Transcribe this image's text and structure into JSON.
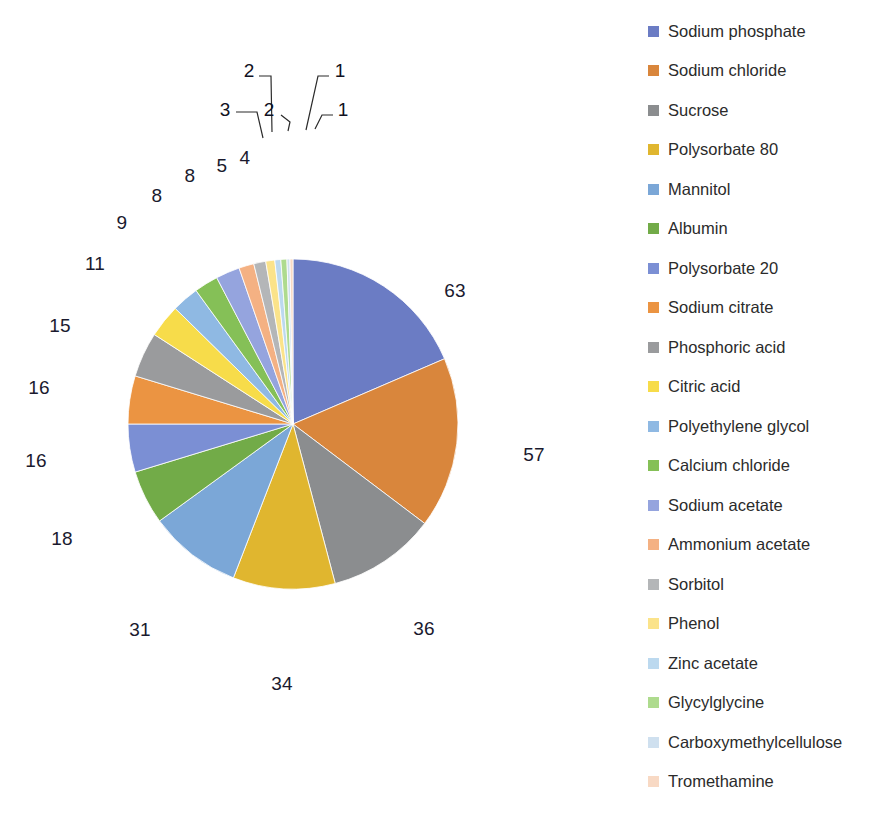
{
  "chart_data": {
    "type": "pie",
    "title": "",
    "subtitle": "",
    "xlabel": "",
    "ylabel": "",
    "grid": false,
    "legend_position": "right",
    "start_angle_deg": 0,
    "direction": "clockwise",
    "total": 336,
    "categories": [
      "Sodium phosphate",
      "Sodium chloride",
      "Sucrose",
      "Polysorbate 80",
      "Mannitol",
      "Albumin",
      "Polysorbate 20",
      "Sodium citrate",
      "Phosphoric acid",
      "Citric acid",
      "Polyethylene glycol",
      "Calcium chloride",
      "Sodium acetate",
      "Ammonium acetate",
      "Sorbitol",
      "Phenol",
      "Zinc acetate",
      "Glycylglycine",
      "Carboxymethylcellulose",
      "Tromethamine"
    ],
    "values": [
      63,
      57,
      36,
      34,
      31,
      18,
      16,
      16,
      15,
      11,
      9,
      8,
      8,
      5,
      4,
      3,
      2,
      2,
      1,
      1
    ],
    "colors": [
      "#6b7cc4",
      "#d9863c",
      "#8b8d8f",
      "#e0b62f",
      "#7ba7d7",
      "#72ab48",
      "#7b8fd4",
      "#eb9442",
      "#9a9b9d",
      "#f7dc4a",
      "#8fb9e3",
      "#85c057",
      "#95a4de",
      "#f4b183",
      "#b4b6b8",
      "#fbe38a",
      "#bcd9ef",
      "#aedb8e",
      "#cfe0ef",
      "#f8d9c4"
    ],
    "data_labels": [
      {
        "value": "63",
        "category": "Sodium phosphate",
        "type": "inside"
      },
      {
        "value": "57",
        "category": "Sodium chloride",
        "type": "inside"
      },
      {
        "value": "36",
        "category": "Sucrose",
        "type": "inside"
      },
      {
        "value": "34",
        "category": "Polysorbate 80",
        "type": "inside"
      },
      {
        "value": "31",
        "category": "Mannitol",
        "type": "inside"
      },
      {
        "value": "18",
        "category": "Albumin",
        "type": "inside"
      },
      {
        "value": "16",
        "category": "Polysorbate 20",
        "type": "inside"
      },
      {
        "value": "16",
        "category": "Sodium citrate",
        "type": "inside"
      },
      {
        "value": "15",
        "category": "Phosphoric acid",
        "type": "inside"
      },
      {
        "value": "11",
        "category": "Citric acid",
        "type": "inside"
      },
      {
        "value": "9",
        "category": "Polyethylene glycol",
        "type": "inside"
      },
      {
        "value": "8",
        "category": "Calcium chloride",
        "type": "inside"
      },
      {
        "value": "8",
        "category": "Sodium acetate",
        "type": "inside"
      },
      {
        "value": "5",
        "category": "Ammonium acetate",
        "type": "inside"
      },
      {
        "value": "4",
        "category": "Sorbitol",
        "type": "inside"
      },
      {
        "value": "3",
        "category": "Phenol",
        "type": "callout"
      },
      {
        "value": "2",
        "category": "Zinc acetate",
        "type": "callout"
      },
      {
        "value": "2",
        "category": "Glycylglycine",
        "type": "callout"
      },
      {
        "value": "1",
        "category": "Carboxymethylcellulose",
        "type": "callout"
      },
      {
        "value": "1",
        "category": "Tromethamine",
        "type": "callout"
      }
    ]
  },
  "pie": {
    "center_x": 293,
    "center_y": 424,
    "radius": 165,
    "inside_labels": [
      {
        "text": "63",
        "x": 455,
        "y": 291
      },
      {
        "text": "57",
        "x": 534,
        "y": 455
      },
      {
        "text": "36",
        "x": 424,
        "y": 629
      },
      {
        "text": "34",
        "x": 282,
        "y": 684
      },
      {
        "text": "31",
        "x": 140,
        "y": 630
      },
      {
        "text": "18",
        "x": 62,
        "y": 539
      },
      {
        "text": "16",
        "x": 36,
        "y": 461
      },
      {
        "text": "16",
        "x": 39,
        "y": 388
      },
      {
        "text": "15",
        "x": 60,
        "y": 326
      },
      {
        "text": "11",
        "x": 95,
        "y": 264
      },
      {
        "text": "9",
        "x": 122,
        "y": 223
      },
      {
        "text": "8",
        "x": 157,
        "y": 196
      },
      {
        "text": "8",
        "x": 190,
        "y": 176
      },
      {
        "text": "5",
        "x": 222,
        "y": 166
      },
      {
        "text": "4",
        "x": 245,
        "y": 158
      }
    ],
    "callout_labels": [
      {
        "text": "3",
        "x": 225,
        "y": 110
      },
      {
        "text": "2",
        "x": 249,
        "y": 71
      },
      {
        "text": "2",
        "x": 269,
        "y": 110
      },
      {
        "text": "1",
        "x": 340,
        "y": 71
      },
      {
        "text": "1",
        "x": 343,
        "y": 110
      }
    ],
    "callout_lines": [
      {
        "points": "236,112 257,112 263,138"
      },
      {
        "points": "259,76 271,76 272,132"
      },
      {
        "points": "281,115 290,122 288,131"
      },
      {
        "points": "329,76 318,76 306,130"
      },
      {
        "points": "333,115 322,115 315,129"
      }
    ]
  },
  "legend": {
    "start_y": 20,
    "row_spacing": 39.5,
    "items": [
      {
        "label": "Sodium phosphate",
        "color": "#6b7cc4"
      },
      {
        "label": "Sodium chloride",
        "color": "#d9863c"
      },
      {
        "label": "Sucrose",
        "color": "#8b8d8f"
      },
      {
        "label": "Polysorbate 80",
        "color": "#e0b62f"
      },
      {
        "label": "Mannitol",
        "color": "#7ba7d7"
      },
      {
        "label": "Albumin",
        "color": "#72ab48"
      },
      {
        "label": "Polysorbate 20",
        "color": "#7b8fd4"
      },
      {
        "label": "Sodium citrate",
        "color": "#eb9442"
      },
      {
        "label": "Phosphoric acid",
        "color": "#9a9b9d"
      },
      {
        "label": "Citric acid",
        "color": "#f7dc4a"
      },
      {
        "label": "Polyethylene glycol",
        "color": "#8fb9e3"
      },
      {
        "label": "Calcium chloride",
        "color": "#85c057"
      },
      {
        "label": "Sodium acetate",
        "color": "#95a4de"
      },
      {
        "label": "Ammonium acetate",
        "color": "#f4b183"
      },
      {
        "label": "Sorbitol",
        "color": "#b4b6b8"
      },
      {
        "label": "Phenol",
        "color": "#fbe38a"
      },
      {
        "label": "Zinc acetate",
        "color": "#bcd9ef"
      },
      {
        "label": "Glycylglycine",
        "color": "#aedb8e"
      },
      {
        "label": "Carboxymethylcellulose",
        "color": "#cfe0ef"
      },
      {
        "label": "Tromethamine",
        "color": "#f8d9c4"
      }
    ]
  }
}
